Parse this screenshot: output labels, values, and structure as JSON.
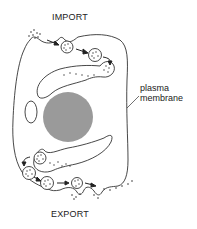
{
  "diagram": {
    "labels": {
      "top": "IMPORT",
      "bottom": "EXPORT",
      "membrane_line1": "plasma",
      "membrane_line2": "membrane"
    },
    "colors": {
      "stroke": "#333333",
      "nucleus": "#9a9a9a",
      "background": "#ffffff"
    }
  }
}
